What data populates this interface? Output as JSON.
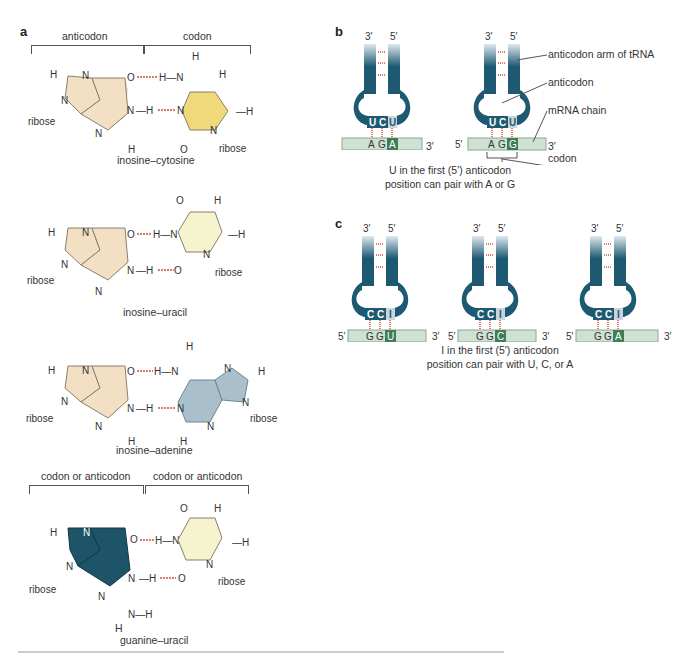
{
  "panels": {
    "a": {
      "letter": "a",
      "top_brackets": {
        "left": "anticodon",
        "right": "codon"
      },
      "bottom_brackets": {
        "left": "codon or anticodon",
        "right": "codon or anticodon"
      },
      "pairs": [
        {
          "name": "inosine–cytosine",
          "left_base": "inosine",
          "right_base": "cytosine",
          "left_color": "#f3dfc3",
          "right_color": "#efd97a"
        },
        {
          "name": "inosine–uracil",
          "left_base": "inosine",
          "right_base": "uracil",
          "left_color": "#f3dfc3",
          "right_color": "#f6f3cf"
        },
        {
          "name": "inosine–adenine",
          "left_base": "inosine",
          "right_base": "adenine",
          "left_color": "#f3dfc3",
          "right_color": "#a9bfcc"
        },
        {
          "name": "guanine–uracil",
          "left_base": "guanine",
          "right_base": "uracil",
          "left_color": "#1e5468",
          "right_color": "#f6f3cf"
        }
      ],
      "atom_labels": {
        "H": "H",
        "N": "N",
        "O": "O",
        "ribose": "ribose"
      }
    },
    "b": {
      "letter": "b",
      "trnas": [
        {
          "end3": "3′",
          "end5": "5′",
          "anticodon": [
            "U",
            "C",
            "U"
          ],
          "codon": [
            "A",
            "G",
            "A"
          ],
          "mrna5": "5′",
          "mrna3": "3′"
        },
        {
          "end3": "3′",
          "end5": "5′",
          "anticodon": [
            "U",
            "C",
            "U"
          ],
          "codon": [
            "A",
            "G",
            "G"
          ],
          "mrna5": "5′",
          "mrna3": "3′"
        }
      ],
      "callouts": [
        "anticodon arm of tRNA",
        "anticodon",
        "mRNA chain",
        "codon"
      ],
      "caption_line1": "U in the first (5′) anticodon",
      "caption_line2": "position can pair with A or G"
    },
    "c": {
      "letter": "c",
      "trnas": [
        {
          "end3": "3′",
          "end5": "5′",
          "anticodon": [
            "C",
            "C",
            "I"
          ],
          "codon": [
            "G",
            "G",
            "U"
          ],
          "mrna5": "5′",
          "mrna3": "3′"
        },
        {
          "end3": "3′",
          "end5": "5′",
          "anticodon": [
            "C",
            "C",
            "I"
          ],
          "codon": [
            "G",
            "G",
            "C"
          ],
          "mrna5": "5′",
          "mrna3": "3′"
        },
        {
          "end3": "3′",
          "end5": "5′",
          "anticodon": [
            "C",
            "C",
            "I"
          ],
          "codon": [
            "G",
            "G",
            "A"
          ],
          "mrna5": "5′",
          "mrna3": "3′"
        }
      ],
      "caption_line1": "I in the first (5′) anticodon",
      "caption_line2": "position can pair with U, C, or A"
    }
  },
  "colors": {
    "trna": "#1d5a72",
    "trna_light": "#dfe8ee",
    "mrna": "#cfe1d3",
    "mrna_border": "#8aa893",
    "wobble_highlight": "#3e7d55",
    "hbond": "#e07a6a",
    "rule": "#cccccc"
  }
}
